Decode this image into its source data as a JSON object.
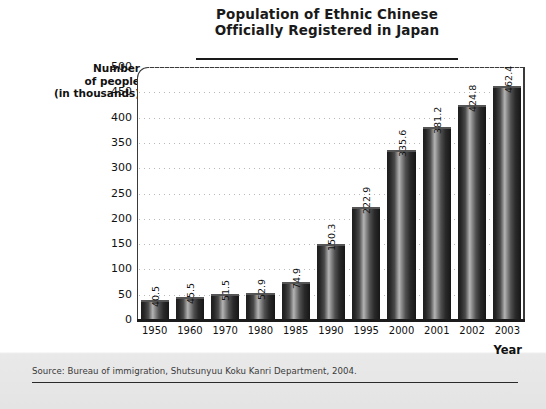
{
  "chart_data": {
    "type": "bar",
    "title": "Population of Ethnic Chinese Officially Registered in Japan",
    "title_line1": "Population of Ethnic Chinese",
    "title_line2": "Officially Registered in Japan",
    "ylabel": "Number of people (in thousands)",
    "ylabel_line1": "Number",
    "ylabel_line2": "of people",
    "ylabel_line3": "(in thousands)",
    "xlabel": "Year",
    "categories": [
      "1950",
      "1960",
      "1970",
      "1980",
      "1985",
      "1990",
      "1995",
      "2000",
      "2001",
      "2002",
      "2003"
    ],
    "values": [
      40.5,
      45.5,
      51.5,
      52.9,
      74.9,
      150.3,
      222.9,
      335.6,
      381.2,
      424.8,
      462.4
    ],
    "value_labels": [
      "40.5",
      "45.5",
      "51.5",
      "52.9",
      "74.9",
      "150.3",
      "222.9",
      "335.6",
      "381.2",
      "424.8",
      "462.4"
    ],
    "ylim": [
      0,
      500
    ],
    "ytick_values": [
      500,
      450,
      400,
      350,
      300,
      250,
      200,
      150,
      100,
      50,
      0
    ],
    "ytick_labels": [
      "500",
      "450",
      "400",
      "350",
      "300",
      "250",
      "200",
      "150",
      "100",
      "50",
      "0"
    ],
    "grid": true,
    "grid_style": "dotted-horizontal",
    "legend": "none",
    "bar_color": "#2b2b2b",
    "bar_style": "cylindrical-gradient",
    "value_label_rotation": 90
  },
  "source": {
    "text": "Source: Bureau of immigration, Shutsunyuu Koku Kanri Department, 2004."
  }
}
